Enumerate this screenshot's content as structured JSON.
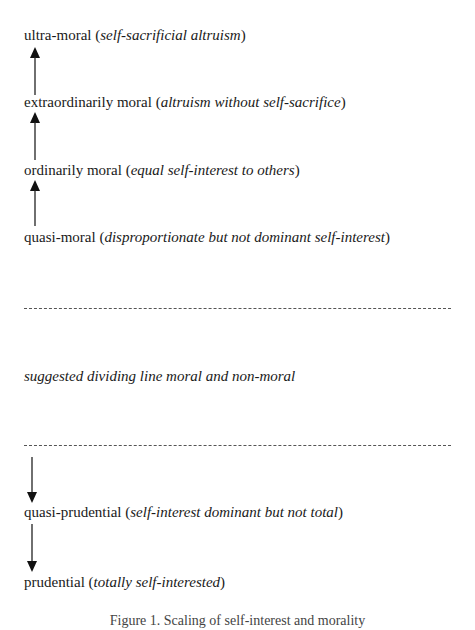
{
  "diagram": {
    "moral_levels": [
      {
        "label": "ultra-moral",
        "description": "self-sacrificial altruism"
      },
      {
        "label": "extraordinarily moral",
        "description": "altruism without self-sacrifice"
      },
      {
        "label": "ordinarily moral",
        "description": "equal self-interest to others"
      },
      {
        "label": "quasi-moral",
        "description": "disproportionate but not dominant self-interest"
      }
    ],
    "divider_label": "suggested dividing line moral and non-moral",
    "non_moral_levels": [
      {
        "label": "quasi-prudential",
        "description": "self-interest dominant but not total"
      },
      {
        "label": "prudential",
        "description": "totally self-interested"
      }
    ],
    "arrows": [
      {
        "direction": "up",
        "from": "extraordinarily moral",
        "to": "ultra-moral"
      },
      {
        "direction": "up",
        "from": "ordinarily moral",
        "to": "extraordinarily moral"
      },
      {
        "direction": "up",
        "from": "quasi-moral",
        "to": "ordinarily moral"
      },
      {
        "direction": "down",
        "from": "divider",
        "to": "quasi-prudential"
      },
      {
        "direction": "down",
        "from": "quasi-prudential",
        "to": "prudential"
      }
    ],
    "caption": "Figure 1.  Scaling of self-interest and morality",
    "open_paren": "(",
    "close_paren": ")"
  }
}
